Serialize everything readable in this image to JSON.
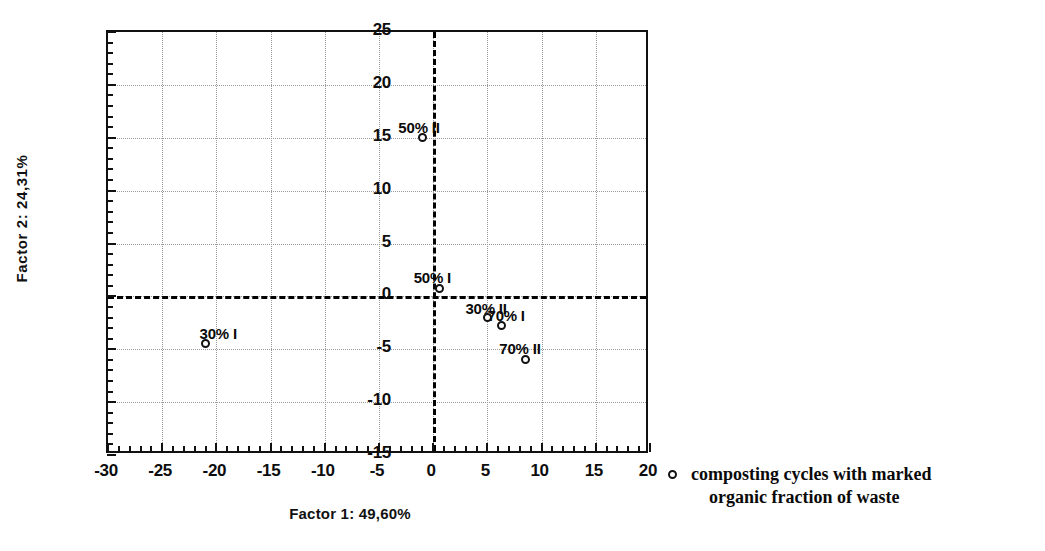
{
  "chart_data": {
    "type": "scatter",
    "title": "",
    "xlabel": "Factor 1: 49,60%",
    "ylabel": "Factor 2: 24,31%",
    "xlim": [
      -30,
      20
    ],
    "ylim": [
      -15,
      25
    ],
    "xticks": [
      -30,
      -25,
      -20,
      -15,
      -10,
      -5,
      0,
      5,
      10,
      15,
      20
    ],
    "xtick_labels": [
      "-30",
      "-25",
      "-20",
      "-15",
      "-10",
      "-5",
      "0",
      "5",
      "10",
      "15",
      "20"
    ],
    "yticks": [
      -15,
      -10,
      -5,
      0,
      5,
      10,
      15,
      20,
      25
    ],
    "ytick_labels": [
      "-15",
      "-10",
      "-5",
      "0",
      "5",
      "10",
      "15",
      "20",
      "25"
    ],
    "grid": true,
    "grid_style": "dotted",
    "zero_lines": {
      "x": 0,
      "y": 0,
      "style": "dashed",
      "color": "#000000"
    },
    "marker": "open-circle",
    "marker_color": "#111111",
    "series": [
      {
        "name": "composting cycles with marked organic fraction of waste",
        "points": [
          {
            "label": "30% I",
            "x": -21.0,
            "y": -4.5,
            "label_dx": -6,
            "label_dy": -19
          },
          {
            "label": "50% II",
            "x": -1.0,
            "y": 15.0,
            "label_dx": -24,
            "label_dy": -19
          },
          {
            "label": "50% I",
            "x": 0.6,
            "y": 0.7,
            "label_dx": -26,
            "label_dy": -20
          },
          {
            "label": "30% II",
            "x": 5.0,
            "y": -2.0,
            "label_dx": -22,
            "label_dy": -18
          },
          {
            "label": "70% I",
            "x": 6.3,
            "y": -2.8,
            "label_dx": -14,
            "label_dy": -19
          },
          {
            "label": "70% II",
            "x": 8.5,
            "y": -6.0,
            "label_dx": -26,
            "label_dy": -20
          }
        ]
      }
    ],
    "legend": {
      "position": "right",
      "entries": [
        {
          "marker": "open-circle",
          "line1": "composting cycles with marked",
          "line2": "organic fraction of waste"
        }
      ]
    }
  }
}
